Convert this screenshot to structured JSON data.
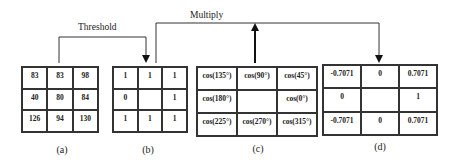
{
  "labels": {
    "threshold": "Threshold",
    "multiply": "Multiply"
  },
  "grids": [
    {
      "caption": "(a)",
      "cells": [
        "83",
        "83",
        "98",
        "40",
        "80",
        "84",
        "126",
        "94",
        "130"
      ]
    },
    {
      "caption": "(b)",
      "cells": [
        "1",
        "1",
        "1",
        "0",
        "",
        "1",
        "1",
        "1",
        "1"
      ]
    },
    {
      "caption": "(c)",
      "cells": [
        "cos(135°)",
        "cos(90°)",
        "cos(45°)",
        "cos(180°)",
        "",
        "cos(0°)",
        "cos(225°)",
        "cos(270°)",
        "cos(315°)"
      ]
    },
    {
      "caption": "(d)",
      "cells": [
        "-0.7071",
        "0",
        "0.7071",
        "0",
        "",
        "1",
        "-0.7071",
        "0",
        "0.7071"
      ]
    }
  ]
}
